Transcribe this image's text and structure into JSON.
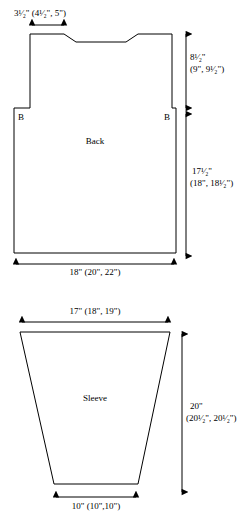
{
  "document": {
    "type": "garment-schematic",
    "pieces": [
      "Back",
      "Sleeve"
    ]
  },
  "back": {
    "piece_label": "Back",
    "shoulder_width_label": "3¹⁄₂\" (4¹⁄₂\", 5\")",
    "armhole_depth_label_line1": "8¹⁄₂\"",
    "armhole_depth_label_line2": "(9\", 9¹⁄₂\")",
    "body_length_label_line1": "17¹⁄₂\"",
    "body_length_label_line2": "(18\", 18¹⁄₂\")",
    "bottom_width_label": "18\" (20\", 22\")",
    "marker_left": "B",
    "marker_right": "B"
  },
  "sleeve": {
    "piece_label": "Sleeve",
    "top_width_label": "17\" (18\", 19\")",
    "length_label_line1": "20\"",
    "length_label_line2": "(20¹⁄₂\", 20¹⁄₂\")",
    "bottom_width_label": "10\" (10\",10\")"
  },
  "style": {
    "line_color": "#000000",
    "background": "#ffffff",
    "text_color": "#000000"
  }
}
